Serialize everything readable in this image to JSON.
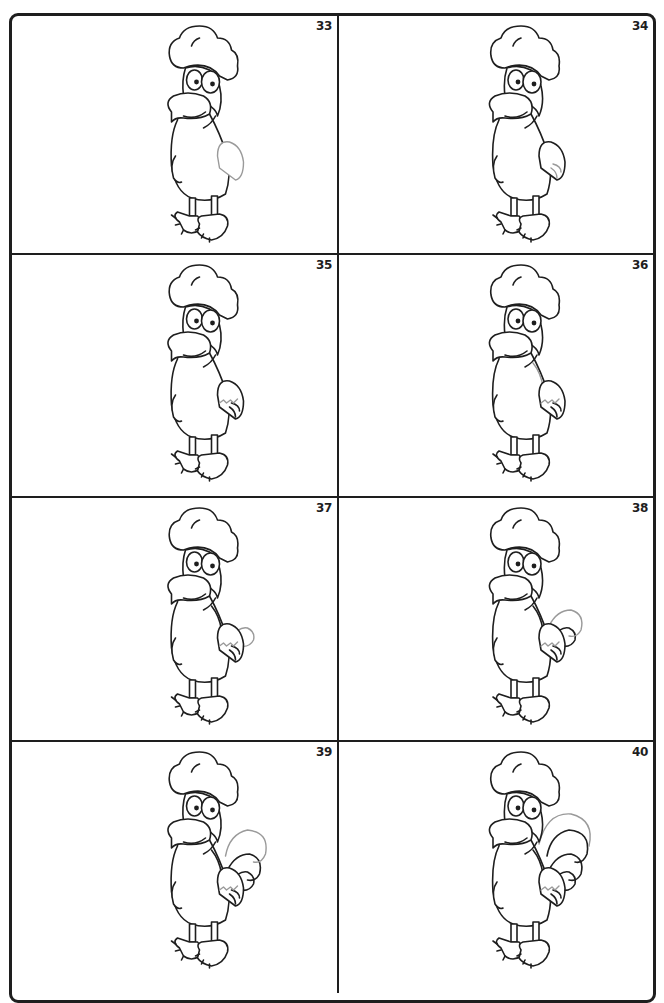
{
  "page": {
    "type": "step-by-step drawing worksheet",
    "layout": {
      "columns": 2,
      "rows": 4
    },
    "colors": {
      "ink": "#1e1e1e",
      "new_stroke": "#9a9a9a",
      "background": "#ffffff"
    }
  },
  "steps": [
    {
      "number": "33",
      "new_part": "wing outline",
      "wing": 1,
      "tail": 0
    },
    {
      "number": "34",
      "new_part": "wing feather tips",
      "wing": 2,
      "tail": 0
    },
    {
      "number": "35",
      "new_part": "wing zigzag division",
      "wing": 3,
      "tail": 0
    },
    {
      "number": "36",
      "new_part": "back line",
      "wing": 3,
      "tail": 1
    },
    {
      "number": "37",
      "new_part": "first tail feather tip",
      "wing": 3,
      "tail": 2
    },
    {
      "number": "38",
      "new_part": "second tail feather",
      "wing": 3,
      "tail": 3
    },
    {
      "number": "39",
      "new_part": "third tail feather",
      "wing": 3,
      "tail": 4
    },
    {
      "number": "40",
      "new_part": "top tail feather",
      "wing": 3,
      "tail": 5
    }
  ]
}
